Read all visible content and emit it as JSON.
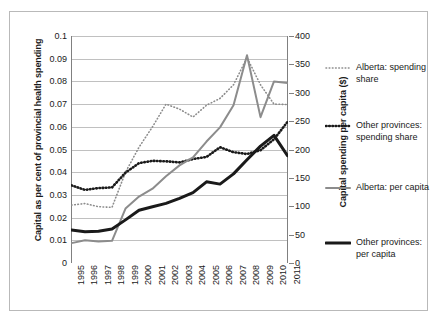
{
  "chart_data": {
    "type": "line",
    "title": "",
    "xlabel": "",
    "ylabel": "Capital as per cent of provincial health spending",
    "ylabel_secondary": "Capital spending per capita ($)",
    "grid": true,
    "legend_position": "right",
    "x": [
      1995,
      1996,
      1997,
      1998,
      1999,
      2000,
      2001,
      2002,
      2003,
      2004,
      2005,
      2006,
      2007,
      2008,
      2009,
      2010,
      2011
    ],
    "categories": [
      "1995",
      "1996",
      "1997",
      "1998",
      "1999",
      "2000",
      "2001",
      "2002",
      "2003",
      "2004",
      "2005",
      "2006",
      "2007",
      "2008",
      "2009",
      "2010",
      "2011"
    ],
    "ylim": [
      0,
      0.1
    ],
    "yticks": [
      0,
      0.01,
      0.02,
      0.03,
      0.04,
      0.05,
      0.06,
      0.07,
      0.08,
      0.09,
      0.1
    ],
    "ytick_labels": [
      "0",
      "0.01",
      "0.02",
      "0.03",
      "0.04",
      "0.05",
      "0.06",
      "0.07",
      "0.08",
      "0.09",
      "0.1"
    ],
    "ylim_secondary": [
      0,
      400
    ],
    "yticks_secondary": [
      0,
      50,
      100,
      150,
      200,
      250,
      300,
      350,
      400
    ],
    "ytick_labels_secondary": [
      "0",
      "50",
      "100",
      "150",
      "200",
      "250",
      "300",
      "350",
      "400"
    ],
    "series": [
      {
        "name": "Alberta: spending share",
        "axis": "left",
        "style": "dotted",
        "color": "#8c8c8c",
        "width": 1.6,
        "values": [
          0.0255,
          0.0262,
          0.0248,
          0.0245,
          0.04,
          0.051,
          0.06,
          0.07,
          0.0678,
          0.0643,
          0.0695,
          0.0725,
          0.0785,
          0.0905,
          0.0785,
          0.07,
          0.0698
        ]
      },
      {
        "name": "Other provinces: spending share",
        "axis": "left",
        "style": "dotted-bold",
        "color": "#1a1a1a",
        "width": 2.6,
        "values": [
          0.0342,
          0.0322,
          0.033,
          0.0333,
          0.0398,
          0.044,
          0.045,
          0.0448,
          0.0443,
          0.0458,
          0.0467,
          0.051,
          0.0488,
          0.048,
          0.0497,
          0.0545,
          0.0622
        ]
      },
      {
        "name": "Alberta: per capita",
        "axis": "right",
        "style": "solid",
        "color": "#8c8c8c",
        "width": 2.0,
        "values": [
          35,
          40,
          38,
          39,
          96,
          117,
          131,
          153,
          172,
          186,
          214,
          239,
          278,
          366,
          257,
          320,
          317
        ]
      },
      {
        "name": "Other provinces: per capita",
        "axis": "right",
        "style": "solid-bold",
        "color": "#1a1a1a",
        "width": 3.0,
        "values": [
          58,
          55,
          56,
          60,
          76,
          93,
          99,
          105,
          114,
          124,
          143,
          139,
          157,
          182,
          206,
          225,
          189
        ]
      }
    ]
  },
  "legend": {
    "items": [
      {
        "label": "Alberta: spending share",
        "swatch": "fine-dotted-gray-swatch"
      },
      {
        "label": "Other provinces: spending share",
        "swatch": "bold-dotted-black-swatch"
      },
      {
        "label": "Alberta: per capita",
        "swatch": "solid-gray-swatch"
      },
      {
        "label": "Other provinces: per capita",
        "swatch": "solid-black-swatch"
      }
    ]
  }
}
